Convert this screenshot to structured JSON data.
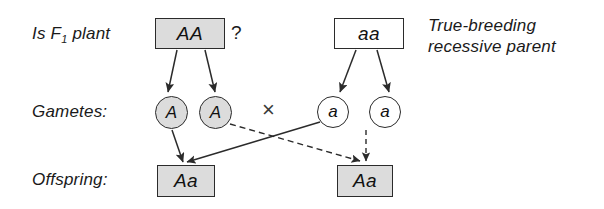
{
  "diagram": {
    "row_labels": {
      "parent_row": "Is F",
      "parent_row_sub": "1",
      "parent_row_tail": " plant",
      "gametes": "Gametes:",
      "offspring": "Offspring:"
    },
    "parents": [
      {
        "name": "f1-parent",
        "genotype": "AA",
        "shaded": true
      },
      {
        "name": "recessive-parent",
        "genotype": "aa",
        "shaded": false
      }
    ],
    "question_mark": "?",
    "cross_symbol": "×",
    "side_note": {
      "line1": "True-breeding",
      "line2": "recessive parent"
    },
    "gametes": [
      {
        "name": "gamete-A-left",
        "allele": "A",
        "shaded": true
      },
      {
        "name": "gamete-A-right",
        "allele": "A",
        "shaded": true
      },
      {
        "name": "gamete-a-left",
        "allele": "a",
        "shaded": false
      },
      {
        "name": "gamete-a-right",
        "allele": "a",
        "shaded": false
      }
    ],
    "offspring": [
      {
        "name": "offspring-left",
        "genotype": "Aa",
        "shaded": true
      },
      {
        "name": "offspring-right",
        "genotype": "Aa",
        "shaded": true
      }
    ],
    "colors": {
      "shade_fill": "#dcdcdc",
      "stroke": "#2b2b2b",
      "text": "#111111",
      "background": "#ffffff"
    }
  }
}
